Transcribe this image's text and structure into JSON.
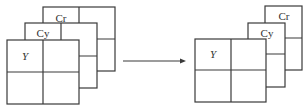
{
  "diagram": {
    "left": {
      "planes": [
        {
          "id": "cr",
          "label": "Cr"
        },
        {
          "id": "cy",
          "label": "Cy"
        },
        {
          "id": "y",
          "label": "Y"
        }
      ]
    },
    "arrow": {
      "direction": "right"
    },
    "right": {
      "planes": [
        {
          "id": "cr",
          "label": "Cr"
        },
        {
          "id": "cy",
          "label": "Cy"
        },
        {
          "id": "y",
          "label": "Y"
        }
      ]
    }
  }
}
